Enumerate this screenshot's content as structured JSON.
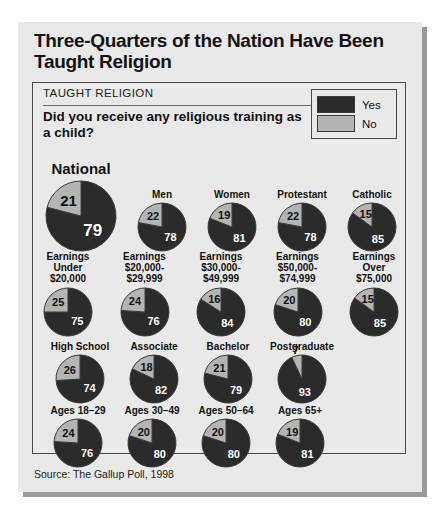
{
  "card": {
    "title": "Three-Quarters of the Nation Have Been Taught Religion",
    "kicker": "TAUGHT RELIGION",
    "question": "Did you receive any religious training as a child?",
    "source": "Source: The Gallup Poll, 1998"
  },
  "legend": {
    "yes_label": "Yes",
    "no_label": "No",
    "yes_color": "#2b2b2b",
    "no_color": "#b4b4b4"
  },
  "chart_data": {
    "type": "pie",
    "title": "Three-Quarters of the Nation Have Been Taught Religion",
    "subtitle": "Did you receive any religious training as a child?",
    "source": "Source: The Gallup Poll, 1998",
    "series_names": [
      "Yes",
      "No"
    ],
    "units": "percent",
    "groups": [
      {
        "row": "demographics",
        "items": [
          {
            "label": "National",
            "no": 21,
            "yes": 79,
            "size": "large"
          },
          {
            "label": "Men",
            "no": 22,
            "yes": 78,
            "size": "small"
          },
          {
            "label": "Women",
            "no": 19,
            "yes": 81,
            "size": "small"
          },
          {
            "label": "Protestant",
            "no": 22,
            "yes": 78,
            "size": "small"
          },
          {
            "label": "Catholic",
            "no": 15,
            "yes": 85,
            "size": "small"
          }
        ]
      },
      {
        "row": "earnings",
        "items": [
          {
            "label": "Earnings\nUnder\n$20,000",
            "no": 25,
            "yes": 75,
            "size": "small"
          },
          {
            "label": "Earnings\n$20,000-\n$29,999",
            "no": 24,
            "yes": 76,
            "size": "small"
          },
          {
            "label": "Earnings\n$30,000-\n$49,999",
            "no": 16,
            "yes": 84,
            "size": "small"
          },
          {
            "label": "Earnings\n$50,000-\n$74,999",
            "no": 20,
            "yes": 80,
            "size": "small"
          },
          {
            "label": "Earnings\nOver\n$75,000",
            "no": 15,
            "yes": 85,
            "size": "small"
          }
        ]
      },
      {
        "row": "education",
        "items": [
          {
            "label": "High School",
            "no": 26,
            "yes": 74,
            "size": "small"
          },
          {
            "label": "Associate",
            "no": 18,
            "yes": 82,
            "size": "small"
          },
          {
            "label": "Bachelor",
            "no": 21,
            "yes": 79,
            "size": "small"
          },
          {
            "label": "Postgraduate",
            "no": 7,
            "yes": 93,
            "size": "small"
          }
        ]
      },
      {
        "row": "ages",
        "items": [
          {
            "label": "Ages 18–29",
            "no": 24,
            "yes": 76,
            "size": "small"
          },
          {
            "label": "Ages 30–49",
            "no": 20,
            "yes": 80,
            "size": "small"
          },
          {
            "label": "Ages 50–64",
            "no": 20,
            "yes": 80,
            "size": "small"
          },
          {
            "label": "Ages 65+",
            "no": 19,
            "yes": 81,
            "size": "small"
          }
        ]
      }
    ]
  }
}
